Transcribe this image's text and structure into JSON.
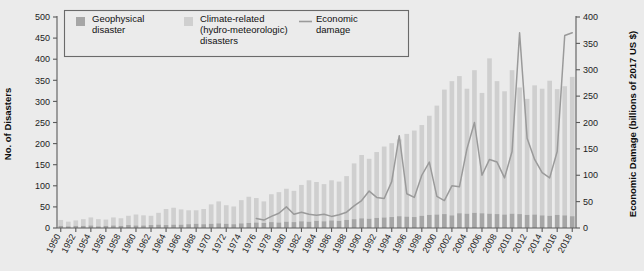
{
  "chart_data": {
    "type": "bar",
    "title": "",
    "subtitle": "",
    "xlabel": "",
    "ylabel": "No. of Disasters",
    "y2label": "Economic Damage (billions of 2017 US $)",
    "ylim": [
      0,
      500
    ],
    "y2lim": [
      0,
      400
    ],
    "yticks": [
      0,
      50,
      100,
      150,
      200,
      250,
      300,
      350,
      400,
      450,
      500
    ],
    "y2ticks": [
      0,
      50,
      100,
      150,
      200,
      250,
      300,
      350,
      400
    ],
    "grid": false,
    "legend_position": "top-left",
    "stacked": true,
    "legend": [
      {
        "label": "Geophysical disaster",
        "type": "swatch",
        "color": "#a6a6a6"
      },
      {
        "label": "Climate-related (hydro-meteorologic) disasters",
        "type": "swatch",
        "color": "#cfcfcf"
      },
      {
        "label": "Economic damage",
        "type": "line",
        "color": "#9a9a9a"
      }
    ],
    "categories": [
      1950,
      1951,
      1952,
      1953,
      1954,
      1955,
      1956,
      1957,
      1958,
      1959,
      1960,
      1961,
      1962,
      1963,
      1964,
      1965,
      1966,
      1967,
      1968,
      1969,
      1970,
      1971,
      1972,
      1973,
      1974,
      1975,
      1976,
      1977,
      1978,
      1979,
      1980,
      1981,
      1982,
      1983,
      1984,
      1985,
      1986,
      1987,
      1988,
      1989,
      1990,
      1991,
      1992,
      1993,
      1994,
      1995,
      1996,
      1997,
      1998,
      1999,
      2000,
      2001,
      2002,
      2003,
      2004,
      2005,
      2006,
      2007,
      2008,
      2009,
      2010,
      2011,
      2012,
      2013,
      2014,
      2015,
      2016,
      2017,
      2018
    ],
    "xtick_labels": [
      "1950",
      "1952",
      "1954",
      "1956",
      "1958",
      "1960",
      "1962",
      "1964",
      "1966",
      "1968",
      "1970",
      "1972",
      "1974",
      "1976",
      "1978",
      "1980",
      "1982",
      "1984",
      "1986",
      "1988",
      "1990",
      "1992",
      "1994",
      "1996",
      "1998",
      "2000",
      "2002",
      "2004",
      "2006",
      "2008",
      "2010",
      "2012",
      "2014",
      "2016",
      "2018"
    ],
    "series": [
      {
        "name": "Geophysical disaster",
        "color": "#a6a6a6",
        "values": [
          5,
          4,
          5,
          5,
          6,
          4,
          5,
          6,
          5,
          7,
          6,
          6,
          7,
          8,
          7,
          8,
          8,
          9,
          10,
          9,
          10,
          11,
          10,
          9,
          11,
          12,
          13,
          12,
          14,
          13,
          15,
          14,
          16,
          15,
          17,
          16,
          18,
          17,
          19,
          21,
          23,
          22,
          24,
          25,
          26,
          28,
          27,
          26,
          29,
          31,
          32,
          33,
          30,
          35,
          34,
          36,
          35,
          34,
          33,
          32,
          34,
          33,
          31,
          32,
          30,
          29,
          31,
          30,
          28
        ]
      },
      {
        "name": "Climate-related (hydro-meteorologic) disasters",
        "color": "#cfcfcf",
        "values": [
          14,
          11,
          13,
          16,
          19,
          17,
          15,
          19,
          18,
          22,
          26,
          24,
          22,
          28,
          38,
          40,
          36,
          33,
          32,
          36,
          46,
          52,
          44,
          42,
          55,
          62,
          58,
          51,
          66,
          72,
          78,
          74,
          86,
          98,
          92,
          88,
          95,
          93,
          104,
          132,
          150,
          142,
          156,
          168,
          175,
          182,
          196,
          205,
          215,
          235,
          258,
          295,
          318,
          325,
          296,
          338,
          285,
          368,
          315,
          292,
          340,
          300,
          275,
          306,
          300,
          320,
          298,
          306,
          330
        ]
      }
    ],
    "line_series": {
      "name": "Economic damage",
      "color": "#9a9a9a",
      "axis": "right",
      "values": [
        null,
        null,
        null,
        null,
        null,
        null,
        null,
        null,
        null,
        null,
        null,
        null,
        null,
        null,
        null,
        null,
        null,
        null,
        null,
        null,
        null,
        null,
        null,
        null,
        null,
        null,
        18,
        15,
        22,
        28,
        40,
        26,
        30,
        26,
        24,
        26,
        22,
        25,
        30,
        42,
        52,
        70,
        58,
        56,
        88,
        175,
        65,
        58,
        100,
        125,
        60,
        52,
        80,
        78,
        150,
        200,
        100,
        130,
        125,
        95,
        145,
        370,
        170,
        130,
        105,
        95,
        145,
        365,
        370
      ]
    }
  }
}
